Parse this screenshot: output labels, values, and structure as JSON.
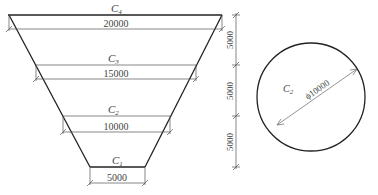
{
  "trapezoid": {
    "sections": [
      {
        "label": "C",
        "sub": "4",
        "dimension": "20000"
      },
      {
        "label": "C",
        "sub": "3",
        "dimension": "15000"
      },
      {
        "label": "C",
        "sub": "2",
        "dimension": "10000"
      },
      {
        "label": "C",
        "sub": "1",
        "dimension": "5000"
      }
    ],
    "height_dims": [
      "5000",
      "5000",
      "5000"
    ]
  },
  "circle": {
    "label": "C",
    "sub": "2",
    "diameter": "ϕ10000"
  }
}
